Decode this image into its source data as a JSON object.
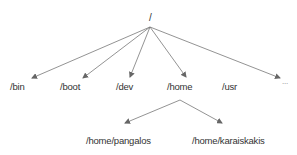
{
  "diagram": {
    "type": "directory-tree",
    "root": {
      "label": "/",
      "x": 151,
      "y": 14
    },
    "level1": [
      {
        "label": "/bin",
        "x": 10,
        "y": 81
      },
      {
        "label": "/boot",
        "x": 60,
        "y": 81
      },
      {
        "label": "/dev",
        "x": 116,
        "y": 81
      },
      {
        "label": "/home",
        "x": 167,
        "y": 81
      },
      {
        "label": "/usr",
        "x": 222,
        "y": 81
      },
      {
        "label": "...",
        "x": 282,
        "y": 79
      }
    ],
    "level2": [
      {
        "label": "/home/pangalos",
        "x": 86,
        "y": 135
      },
      {
        "label": "/home/karaiskakis",
        "x": 192,
        "y": 135
      }
    ],
    "line_color": "#666666",
    "text_color": "#333333"
  }
}
